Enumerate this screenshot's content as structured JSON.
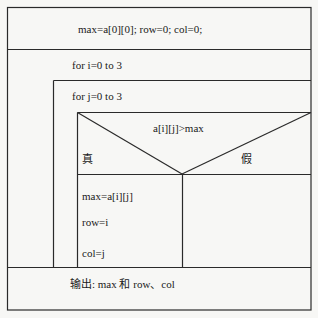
{
  "diagram": {
    "type": "N-S flowchart (Nassi-Shneiderman)",
    "init": "max=a[0][0]; row=0; col=0;",
    "outer_loop": "for  i=0   to   3",
    "inner_loop": "for j=0   to   3",
    "condition": "a[i][j]>max",
    "true_label": "真",
    "false_label": "假",
    "true_branch": [
      "max=a[i][j]",
      "row=i",
      "col=j"
    ],
    "output": "输出: max  和 row、col"
  },
  "colors": {
    "line": "#2a2a2a",
    "background": "#f7f7f5"
  }
}
